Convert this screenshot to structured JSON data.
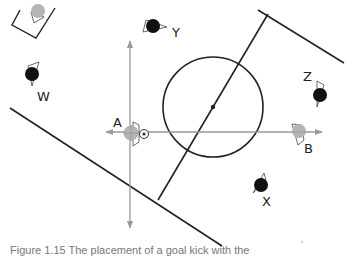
{
  "figure": {
    "caption": "Figure 1.15 The placement of a goal kick with the"
  },
  "colors": {
    "line": "#222222",
    "axis": "#999999",
    "team_gray": "#b5b5b5",
    "team_black": "#111111"
  },
  "players": [
    {
      "id": "A",
      "label": "A",
      "team": "gray"
    },
    {
      "id": "B",
      "label": "B",
      "team": "gray"
    },
    {
      "id": "W",
      "label": "W",
      "team": "black"
    },
    {
      "id": "X",
      "label": "X",
      "team": "black"
    },
    {
      "id": "Y",
      "label": "Y",
      "team": "black"
    },
    {
      "id": "Z",
      "label": "Z",
      "team": "black"
    }
  ],
  "elements": {
    "ball": "ball",
    "center_circle": "center circle",
    "center_spot": "center spot",
    "halfway_line": "halfway line",
    "goal_area": "goal area"
  }
}
